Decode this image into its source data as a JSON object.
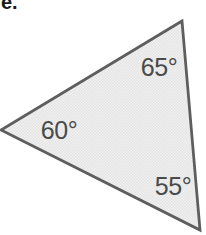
{
  "item_label": "e.",
  "figure": {
    "type": "triangle",
    "points": "182,21 1,130 200,230",
    "stroke_color": "#5e5e5e",
    "fill_base": "#f1f1f1",
    "fill_texture": "#e2e2e2",
    "label_color": "#4a4a4a",
    "angle_labels": [
      {
        "text": "65°",
        "value": 65
      },
      {
        "text": "60°",
        "value": 60
      },
      {
        "text": "55°",
        "value": 55
      }
    ]
  }
}
